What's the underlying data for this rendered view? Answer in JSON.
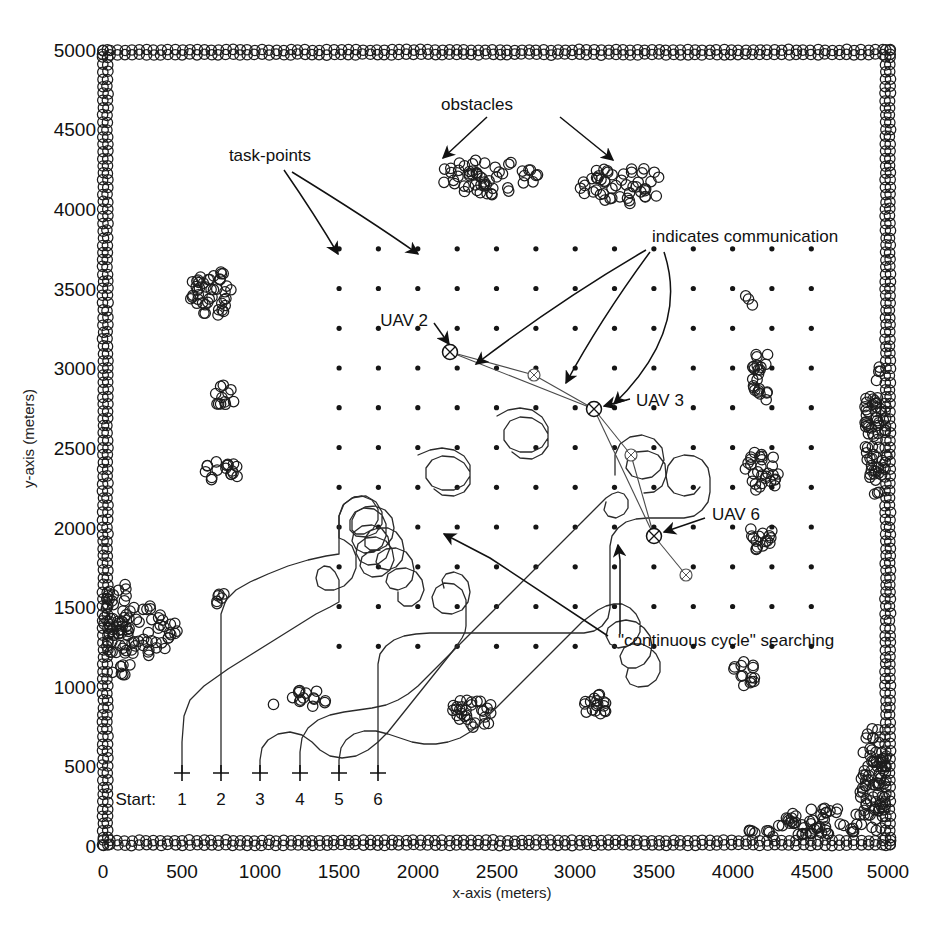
{
  "figure": {
    "x_axis_label": "x-axis (meters)",
    "y_axis_label": "y-axis (meters)",
    "start_label": "Start:"
  },
  "annotations": {
    "obstacles": "obstacles",
    "task_points": "task-points",
    "indicates_communication": "indicates communication",
    "uav2": "UAV 2",
    "uav3": "UAV 3",
    "uav6": "UAV 6",
    "continuous_cycle": "\"continuous cycle\" searching"
  },
  "start_markers": [
    {
      "label": "1",
      "x": 500,
      "y": 500
    },
    {
      "label": "2",
      "x": 750,
      "y": 500
    },
    {
      "label": "3",
      "x": 1000,
      "y": 500
    },
    {
      "label": "4",
      "x": 1250,
      "y": 500
    },
    {
      "label": "5",
      "x": 1500,
      "y": 500
    },
    {
      "label": "6",
      "x": 1750,
      "y": 500
    }
  ],
  "uav_markers": [
    {
      "name": "UAV 2",
      "x": 2200,
      "y": 3120
    },
    {
      "name": "UAV 3",
      "x": 3120,
      "y": 2760
    },
    {
      "name": "UAV 6",
      "x": 3500,
      "y": 1980
    },
    {
      "name": "unlabeled-a",
      "x": 2700,
      "y": 3000
    },
    {
      "name": "unlabeled-b",
      "x": 3240,
      "y": 2500
    },
    {
      "name": "unlabeled-c",
      "x": 3700,
      "y": 1730
    }
  ],
  "colors": {
    "ink": "#111111",
    "paper": "#ffffff",
    "grid_point": "#1a1a1a",
    "obstacle": "#222222",
    "path": "#333333"
  },
  "chart_data": {
    "type": "scatter",
    "title": "",
    "xlabel": "x-axis (meters)",
    "ylabel": "y-axis (meters)",
    "xlim": [
      0,
      5000
    ],
    "ylim": [
      0,
      5000
    ],
    "xticks": [
      0,
      500,
      1000,
      1500,
      2000,
      2500,
      3000,
      3500,
      4000,
      4500,
      5000
    ],
    "yticks": [
      0,
      500,
      1000,
      1500,
      2000,
      2500,
      3000,
      3500,
      4000,
      4500,
      5000
    ],
    "grid": false,
    "legend": "none",
    "series": [
      {
        "name": "task-points",
        "marker": "dot",
        "description": "Regular 11x11 lattice of task points spanning 1500..4500 m in x and 1250..3750 m in y, spaced 250 m apart",
        "x_start": 1500,
        "x_end": 4500,
        "x_step": 250,
        "y_start": 1250,
        "y_end": 3750,
        "y_step": 250
      },
      {
        "name": "boundary-obstacles",
        "marker": "open-circle",
        "description": "Dense chains of open circles forming the rectangular border of the 5000x5000 m search region plus thickened corner build-ups at lower-right and left edge"
      },
      {
        "name": "interior-obstacle-clusters",
        "marker": "open-circle",
        "clusters": [
          {
            "cx": 2450,
            "cy": 4200,
            "rx": 320,
            "ry": 110,
            "n": 55
          },
          {
            "cx": 3300,
            "cy": 4150,
            "rx": 280,
            "ry": 120,
            "n": 50
          },
          {
            "cx": 700,
            "cy": 3480,
            "rx": 150,
            "ry": 150,
            "n": 45
          },
          {
            "cx": 770,
            "cy": 2830,
            "rx": 70,
            "ry": 85,
            "n": 12
          },
          {
            "cx": 760,
            "cy": 2350,
            "rx": 110,
            "ry": 80,
            "n": 18
          },
          {
            "cx": 750,
            "cy": 1550,
            "rx": 45,
            "ry": 45,
            "n": 6
          },
          {
            "cx": 250,
            "cy": 1350,
            "rx": 230,
            "ry": 160,
            "n": 60
          },
          {
            "cx": 1100,
            "cy": 880,
            "rx": 20,
            "ry": 20,
            "n": 1
          },
          {
            "cx": 1300,
            "cy": 925,
            "rx": 140,
            "ry": 55,
            "n": 14
          },
          {
            "cx": 2350,
            "cy": 830,
            "rx": 150,
            "ry": 95,
            "n": 30
          },
          {
            "cx": 3150,
            "cy": 870,
            "rx": 110,
            "ry": 80,
            "n": 18
          },
          {
            "cx": 4100,
            "cy": 3420,
            "rx": 35,
            "ry": 50,
            "n": 3
          },
          {
            "cx": 4180,
            "cy": 2950,
            "rx": 60,
            "ry": 190,
            "n": 24
          },
          {
            "cx": 4180,
            "cy": 2340,
            "rx": 110,
            "ry": 140,
            "n": 30
          },
          {
            "cx": 4180,
            "cy": 1950,
            "rx": 90,
            "ry": 100,
            "n": 16
          },
          {
            "cx": 4080,
            "cy": 1080,
            "rx": 85,
            "ry": 80,
            "n": 14
          }
        ]
      },
      {
        "name": "uav-paths",
        "marker": "polyline",
        "description": "Six UAV trajectories launched from the Start markers along the bottom, sweeping upward through the task-point lattice in looping continuous cycles"
      },
      {
        "name": "communication-links",
        "marker": "thin-line",
        "description": "Long straight thin lines connecting UAV 2, UAV 3 and UAV 6 marker positions, indicating inter-vehicle communication"
      }
    ]
  }
}
